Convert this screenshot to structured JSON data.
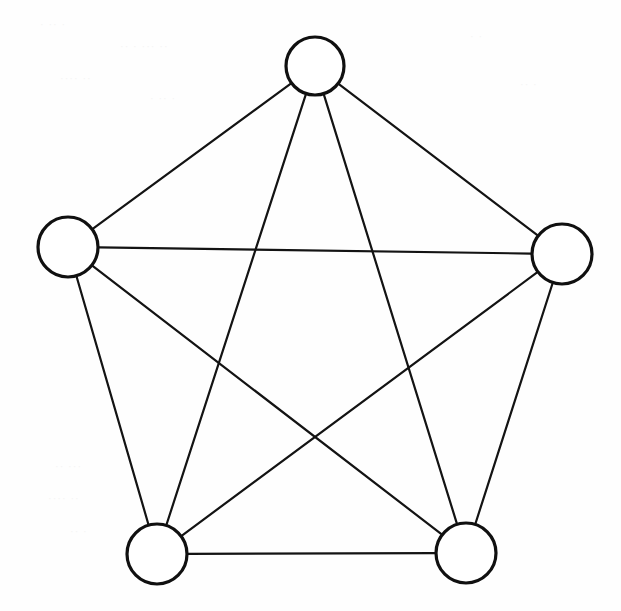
{
  "figure": {
    "title": "",
    "caption": "",
    "background_color": "#fefefe",
    "stroke_color": "#131313",
    "node_fill_color": "#ffffff",
    "width": 621,
    "height": 611
  },
  "graph": {
    "type": "complete-graph",
    "name": "K5",
    "node_count": 5,
    "edge_count": 10,
    "directed": false,
    "labels_visible": false,
    "nodes": [
      {
        "id": "n1",
        "label": "",
        "cx": 315,
        "cy": 66,
        "r": 29,
        "position": "top"
      },
      {
        "id": "n2",
        "label": "",
        "cx": 562,
        "cy": 254,
        "r": 30,
        "position": "right"
      },
      {
        "id": "n3",
        "label": "",
        "cx": 466,
        "cy": 553,
        "r": 30,
        "position": "bottom-right"
      },
      {
        "id": "n4",
        "label": "",
        "cx": 157,
        "cy": 554,
        "r": 30,
        "position": "bottom-left"
      },
      {
        "id": "n5",
        "label": "",
        "cx": 68,
        "cy": 247,
        "r": 30,
        "position": "left"
      }
    ],
    "edges": [
      {
        "id": "e1",
        "from": "n1",
        "to": "n2",
        "kind": "outer"
      },
      {
        "id": "e2",
        "from": "n2",
        "to": "n3",
        "kind": "outer"
      },
      {
        "id": "e3",
        "from": "n3",
        "to": "n4",
        "kind": "outer"
      },
      {
        "id": "e4",
        "from": "n4",
        "to": "n5",
        "kind": "outer"
      },
      {
        "id": "e5",
        "from": "n5",
        "to": "n1",
        "kind": "outer"
      },
      {
        "id": "e6",
        "from": "n1",
        "to": "n3",
        "kind": "diagonal"
      },
      {
        "id": "e7",
        "from": "n1",
        "to": "n4",
        "kind": "diagonal"
      },
      {
        "id": "e8",
        "from": "n2",
        "to": "n4",
        "kind": "diagonal"
      },
      {
        "id": "e9",
        "from": "n2",
        "to": "n5",
        "kind": "diagonal"
      },
      {
        "id": "e10",
        "from": "n3",
        "to": "n5",
        "kind": "diagonal"
      }
    ]
  },
  "artifacts": {
    "note": "faint scanned bleed-through marks, illegible",
    "marks": [
      {
        "x": 40,
        "y": 18,
        "text": "· ·· ·"
      },
      {
        "x": 120,
        "y": 40,
        "text": "·· · ··· ··"
      },
      {
        "x": 60,
        "y": 72,
        "text": "···· ··"
      },
      {
        "x": 150,
        "y": 92,
        "text": "· ·· ·"
      },
      {
        "x": 55,
        "y": 460,
        "text": "·· ···"
      },
      {
        "x": 48,
        "y": 492,
        "text": "···· ··"
      },
      {
        "x": 70,
        "y": 525,
        "text": "·· ·"
      },
      {
        "x": 470,
        "y": 30,
        "text": "· ·"
      },
      {
        "x": 520,
        "y": 78,
        "text": "·· ·"
      }
    ]
  }
}
